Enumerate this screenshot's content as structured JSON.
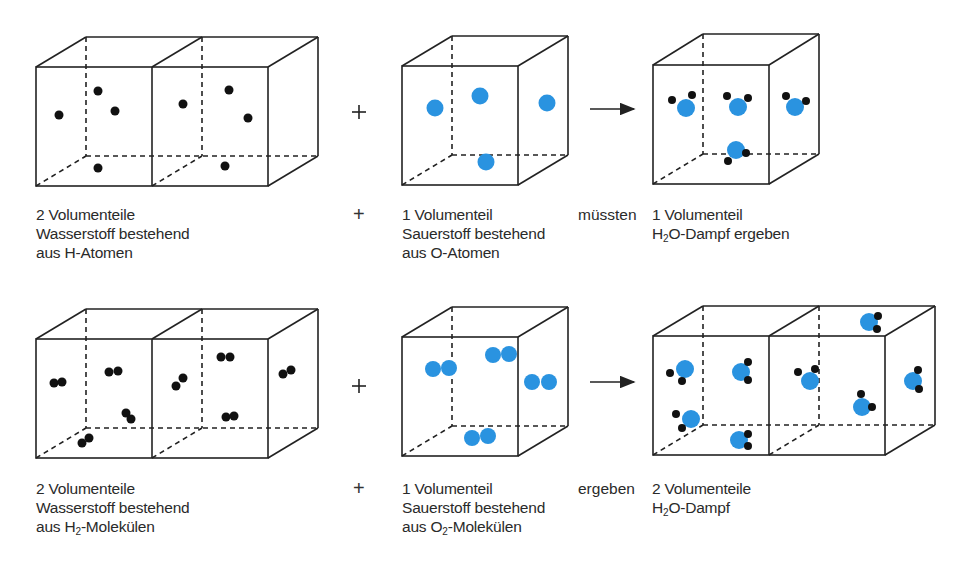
{
  "colors": {
    "hydrogen": "#111111",
    "oxygen": "#2a93e0",
    "line": "#222222"
  },
  "row1": {
    "left_label": [
      "2 Volumenteile",
      "Wasserstoff bestehend",
      "aus H-Atomen"
    ],
    "plus": "+",
    "middle_label": [
      "1 Volumenteil",
      "Sauerstoff bestehend",
      "aus O-Atomen"
    ],
    "connector": "müssten",
    "right_label_line1": "1 Volumenteil",
    "right_label_line2_pre": "H",
    "right_label_line2_sub": "2",
    "right_label_line2_post": "O-Dampf ergeben"
  },
  "row2": {
    "left_label_line1": "2 Volumenteile",
    "left_label_line2": "Wasserstoff bestehend",
    "left_label_line3_pre": "aus H",
    "left_label_line3_sub": "2",
    "left_label_line3_post": "-Molekülen",
    "plus": "+",
    "middle_label_line1": "1 Volumenteil",
    "middle_label_line2": "Sauerstoff bestehend",
    "middle_label_line3_pre": "aus O",
    "middle_label_line3_sub": "2",
    "middle_label_line3_post": "-Molekülen",
    "connector": "ergeben",
    "right_label_line1": "2 Volumenteile",
    "right_label_line2_pre": "H",
    "right_label_line2_sub": "2",
    "right_label_line2_post": "O-Dampf"
  },
  "figure_plus_signs": [
    "+",
    "+"
  ],
  "arrows": [
    "reaction-arrow",
    "reaction-arrow"
  ]
}
